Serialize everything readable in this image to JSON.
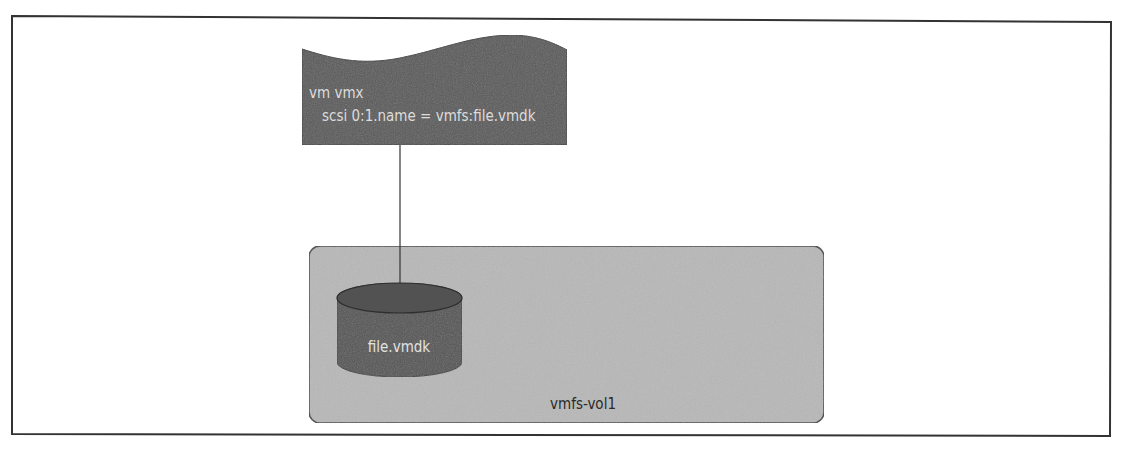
{
  "diagram": {
    "config_file": {
      "title": "vm vmx",
      "entry": "scsi 0:1.name = vmfs:file.vmdk",
      "shape": "document",
      "fill_color": "#5a5a5a",
      "text_color": "#dcdcdc"
    },
    "disk_file": {
      "label": "file.vmdk",
      "shape": "cylinder",
      "fill_color": "#555555",
      "text_color": "#e2e2e2"
    },
    "volume": {
      "label": "vmfs-vol1",
      "shape": "rounded-rectangle",
      "fill_color": "#b8b8b8",
      "text_color": "#2a2a2a"
    },
    "connector": {
      "from": "config_file",
      "to": "disk_file",
      "color": "#333333"
    },
    "frame": {
      "border_color": "#333333"
    }
  }
}
